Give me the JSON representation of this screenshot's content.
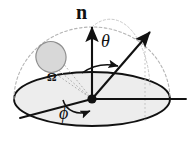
{
  "figure": {
    "background_color": "#ffffff",
    "stroke_color": "#111111",
    "dashed_color": "#b0b0b0",
    "dotted_color": "#9a9a9a",
    "plane_fill": "#ededed",
    "patch_fill": "#d8d8d8",
    "patch_stroke": "#8f8f8f",
    "labels": {
      "normal": "n",
      "theta": "θ",
      "phi": "ϕ",
      "omega": "Ω"
    },
    "elements": {
      "normal_vector": "normal-vector-arrow",
      "direction_ray": "direction-ray-arrow",
      "theta_arc": "theta-angle-arc",
      "phi_arc": "phi-angle-arc",
      "hemisphere": "hemisphere-dashed-arc",
      "ground_plane": "ground-plane-ellipse",
      "origin": "origin-point",
      "solid_angle_patch": "solid-angle-patch",
      "azimuth_reference": "azimuth-reference-line",
      "horizontal_axis": "horizontal-axis-line",
      "projection_line": "projection-drop-line"
    },
    "geometry": {
      "origin_x": 92,
      "origin_y": 99,
      "ellipse_rx": 78,
      "ellipse_ry": 27,
      "hemisphere_rx": 78,
      "hemisphere_ry": 72
    }
  }
}
